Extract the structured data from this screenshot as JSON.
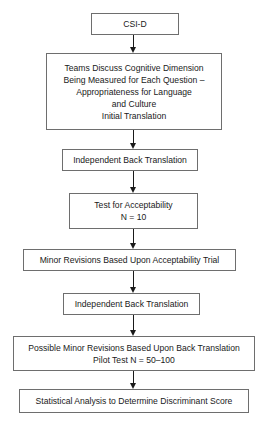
{
  "flowchart": {
    "steps": [
      {
        "lines": [
          "CSI-D"
        ]
      },
      {
        "lines": [
          "Teams Discuss Cognitive Dimension",
          "Being Measured for Each Question –",
          "Appropriateness for Language",
          "and Culture",
          "Initial Translation"
        ]
      },
      {
        "lines": [
          "Independent Back Translation"
        ]
      },
      {
        "lines": [
          "Test for Acceptability",
          "N = 10"
        ]
      },
      {
        "lines": [
          "Minor Revisions Based Upon Acceptability Trial"
        ]
      },
      {
        "lines": [
          "Independent Back Translation"
        ]
      },
      {
        "lines": [
          "Possible Minor Revisions Based Upon Back Translation",
          "Pilot Test N = 50–100"
        ]
      },
      {
        "lines": [
          "Statistical Analysis to Determine Discriminant Score"
        ]
      }
    ],
    "connectors": [
      {
        "from": 0,
        "to": 1,
        "type": "arrow"
      },
      {
        "from": 1,
        "to": 2,
        "type": "arrow"
      },
      {
        "from": 2,
        "to": 3,
        "type": "arrow"
      },
      {
        "from": 3,
        "to": 4,
        "type": "arrow"
      },
      {
        "from": 4,
        "to": 5,
        "type": "arrow"
      },
      {
        "from": 5,
        "to": 6,
        "type": "arrow"
      },
      {
        "from": 6,
        "to": 7,
        "type": "arrow"
      }
    ],
    "colors": {
      "box_border": "#6e6e6e",
      "arrow": "#1a1a1a",
      "text": "#1a1a1a",
      "background": "#ffffff"
    }
  }
}
